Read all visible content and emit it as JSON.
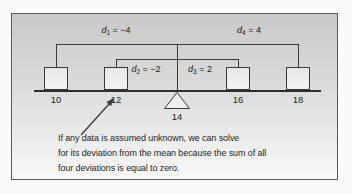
{
  "colors": {
    "frame_border": "#5a5a5a",
    "line": "#3a3a3a",
    "background_top": "#c9c9c9",
    "background_bottom": "#f8f8f8",
    "box_fill": "#eeeeee",
    "text": "#262626"
  },
  "diagram": {
    "deviations": [
      {
        "var": "d",
        "sub": "1",
        "eq": "= −4"
      },
      {
        "var": "d",
        "sub": "2",
        "eq": "= −2"
      },
      {
        "var": "d",
        "sub": "3",
        "eq": "= 2"
      },
      {
        "var": "d",
        "sub": "4",
        "eq": "= 4"
      }
    ],
    "values": [
      "10",
      "12",
      "16",
      "18"
    ],
    "mean": "14",
    "caption": [
      "If any data is assumed unknown, we can solve",
      "for its deviation from the mean because the sum of all",
      "four deviations is equal to zero."
    ]
  }
}
